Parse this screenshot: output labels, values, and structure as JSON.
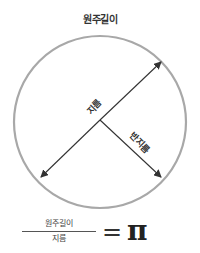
{
  "diagram": {
    "title": "원주길이",
    "labels": {
      "circumference": "원주길이",
      "diameter": "지름",
      "radius": "반지름"
    },
    "formula": {
      "numerator": "원주길이",
      "denominator": "지름",
      "equals": "=",
      "result": "π"
    },
    "colors": {
      "circle_stroke": "#a8a8a8",
      "arrow_stroke": "#333333",
      "text": "#333333"
    },
    "circle": {
      "cx": 100,
      "cy": 122,
      "r": 86
    }
  }
}
